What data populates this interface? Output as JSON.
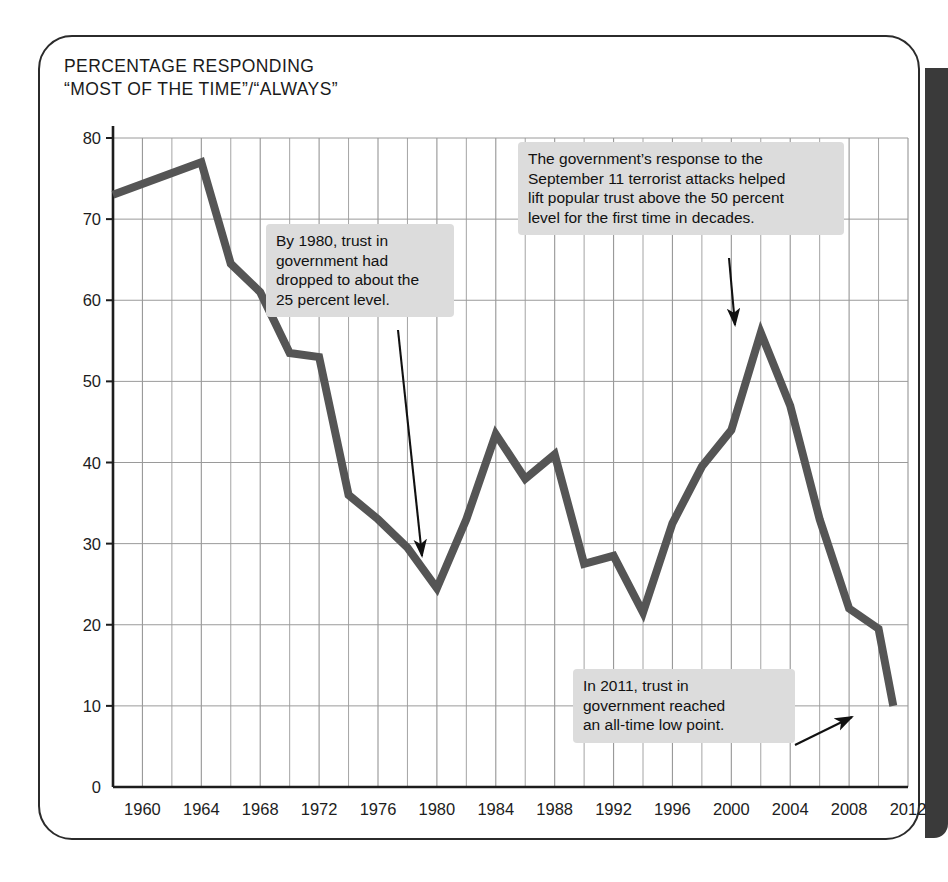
{
  "figure": {
    "title": "PERCENTAGE RESPONDING\n“MOST OF THE TIME”/“ALWAYS”",
    "line_color": "#555555",
    "grid_color": "#9a9a9a",
    "axis_color": "#1d1d1d",
    "callout_bg": "#dcdcdc",
    "edge_bar_color": "#3a3a3a"
  },
  "annotations": {
    "a1980": "By 1980, trust in\ngovernment had\ndropped to about the\n25 percent level.",
    "sept11": "The government’s response to the\nSeptember 11 terrorist attacks helped\nlift popular trust above the 50 percent\nlevel for the first time in decades.",
    "a2011": "In 2011, trust in\ngovernment reached\nan all-time low point."
  },
  "chart_data": {
    "type": "line",
    "title": "PERCENTAGE RESPONDING “MOST OF THE TIME”/“ALWAYS”",
    "xlabel": "",
    "ylabel": "",
    "xlim": [
      1958,
      2012
    ],
    "ylim": [
      0,
      80
    ],
    "ytick_labels": [
      "0",
      "10",
      "20",
      "30",
      "40",
      "50",
      "60",
      "70",
      "80"
    ],
    "yticks": [
      0,
      10,
      20,
      30,
      40,
      50,
      60,
      70,
      80
    ],
    "xtick_labels": [
      "1960",
      "1964",
      "1968",
      "1972",
      "1976",
      "1980",
      "1984",
      "1988",
      "1992",
      "1996",
      "2000",
      "2004",
      "2008",
      "2012"
    ],
    "xticks": [
      1960,
      1964,
      1968,
      1972,
      1976,
      1980,
      1984,
      1988,
      1992,
      1996,
      2000,
      2004,
      2008,
      2012
    ],
    "grid": true,
    "minor_grid_step_x": 2,
    "legend": null,
    "x": [
      1958,
      1964,
      1966,
      1968,
      1970,
      1972,
      1974,
      1976,
      1978,
      1980,
      1982,
      1984,
      1986,
      1988,
      1990,
      1992,
      1994,
      1996,
      1998,
      2000,
      2002,
      2004,
      2006,
      2008,
      2010,
      2011
    ],
    "values": [
      73,
      77,
      64.5,
      61,
      53.5,
      53,
      36,
      33,
      29.5,
      24.5,
      33,
      43.5,
      38,
      41,
      27.5,
      28.5,
      21.5,
      32.5,
      39.5,
      44,
      56,
      47,
      33,
      22,
      19.5,
      10
    ],
    "annotation_points": [
      {
        "label": "1980 low",
        "x": 1980,
        "y": 24.5
      },
      {
        "label": "2002 post-9/11 peak",
        "x": 2002,
        "y": 56
      },
      {
        "label": "2011 all-time low",
        "x": 2011,
        "y": 10
      }
    ]
  }
}
